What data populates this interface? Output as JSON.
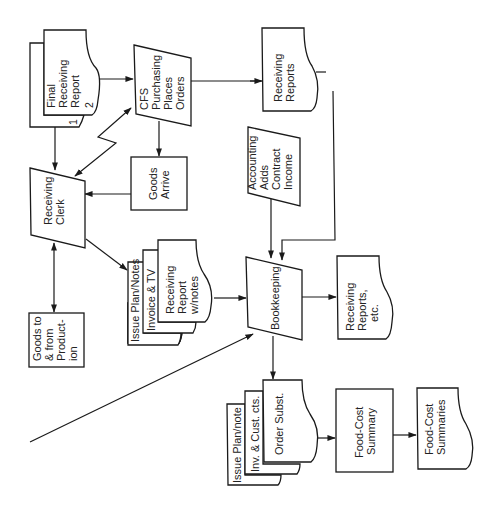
{
  "diagram": {
    "type": "flowchart",
    "orientation": "rotated-90-ccw",
    "colors": {
      "ink": "#1a1a1a",
      "background": "#ffffff"
    },
    "nodes": {
      "final_receiving_report": {
        "shape": "document-stack",
        "lines": [
          "Final",
          "Receiving",
          "Report",
          "2"
        ],
        "back_label": "1"
      },
      "cfs_purchasing": {
        "shape": "manual-input",
        "lines": [
          "CFS",
          "Purchasing",
          "Places",
          "Orders"
        ]
      },
      "receiving_reports_top": {
        "shape": "document",
        "lines": [
          "Receiving",
          "Reports"
        ]
      },
      "receiving_clerk": {
        "shape": "manual-input",
        "lines": [
          "Receiving",
          "Clerk"
        ]
      },
      "goods_arrive": {
        "shape": "process",
        "lines": [
          "Goods",
          "Arrive"
        ]
      },
      "accounting_adds": {
        "shape": "manual-input",
        "lines": [
          "Accounting",
          "Adds",
          "Contract",
          "Income"
        ]
      },
      "goods_to_from_production": {
        "shape": "process",
        "lines": [
          "Goods to",
          "& from",
          "Product-",
          "ion"
        ]
      },
      "issue_plan_stack": {
        "shape": "document-stack",
        "layers": [
          "Issue Plan/Notes",
          "Invoice & TV"
        ],
        "lines": [
          "Receiving",
          "Report",
          "w/notes"
        ]
      },
      "bookkeeping": {
        "shape": "manual-input",
        "lines": [
          "Bookkeeping"
        ]
      },
      "receiving_reports_etc": {
        "shape": "document",
        "lines": [
          "Receiving",
          "Reports,",
          "etc."
        ]
      },
      "order_subst_stack": {
        "shape": "document-stack",
        "layers": [
          "Issue Plan/note",
          "Inv. & Cust. cts."
        ],
        "lines": [
          "Order Subst."
        ]
      },
      "food_cost_summary": {
        "shape": "process",
        "lines": [
          "Food-Cost",
          "Summary"
        ]
      },
      "food_cost_summaries": {
        "shape": "document",
        "lines": [
          "Food-Cost",
          "Summaries"
        ]
      }
    },
    "edges": [
      {
        "from": "final_receiving_report",
        "to": "cfs_purchasing"
      },
      {
        "from": "final_receiving_report",
        "to": "receiving_clerk"
      },
      {
        "from": "cfs_purchasing",
        "to": "receiving_clerk",
        "style": "lightning-bidirectional"
      },
      {
        "from": "cfs_purchasing",
        "to": "goods_arrive"
      },
      {
        "from": "cfs_purchasing",
        "to": "receiving_reports_top"
      },
      {
        "from": "goods_arrive",
        "to": "receiving_clerk"
      },
      {
        "from": "receiving_clerk",
        "to": "issue_plan_stack"
      },
      {
        "from": "receiving_clerk",
        "to": "goods_to_from_production",
        "style": "bidirectional"
      },
      {
        "from": "receiving_reports_top",
        "to": "bookkeeping"
      },
      {
        "from": "accounting_adds",
        "to": "bookkeeping"
      },
      {
        "from": "issue_plan_stack",
        "to": "bookkeeping"
      },
      {
        "from": "external",
        "to": "bookkeeping",
        "style": "diagonal-long"
      },
      {
        "from": "bookkeeping",
        "to": "receiving_reports_etc"
      },
      {
        "from": "bookkeeping",
        "to": "order_subst_stack"
      },
      {
        "from": "order_subst_stack",
        "to": "food_cost_summary"
      },
      {
        "from": "food_cost_summary",
        "to": "food_cost_summaries"
      }
    ]
  }
}
